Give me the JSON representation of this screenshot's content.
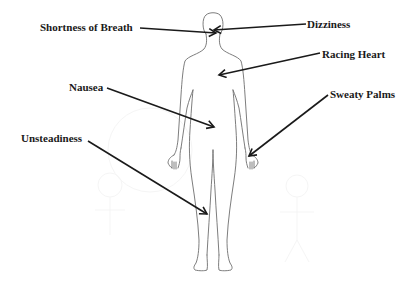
{
  "diagram": {
    "type": "annotated-body-figure",
    "colors": {
      "background": "#ffffff",
      "outline": "#6e6e6e",
      "arrow": "#1a1a1a",
      "text": "#1a1a1a"
    },
    "labels": [
      {
        "id": "shortness-of-breath",
        "text": "Shortness of Breath",
        "x": 40,
        "y": 20,
        "arrow_from": [
          140,
          27
        ],
        "arrow_to": [
          216,
          32
        ]
      },
      {
        "id": "dizziness",
        "text": "Dizziness",
        "x": 307,
        "y": 14,
        "arrow_from": [
          306,
          20
        ],
        "arrow_to": [
          214,
          25
        ]
      },
      {
        "id": "racing-heart",
        "text": "Racing Heart",
        "x": 322,
        "y": 44,
        "arrow_from": [
          320,
          50
        ],
        "arrow_to": [
          219,
          75
        ]
      },
      {
        "id": "nausea",
        "text": "Nausea",
        "x": 69,
        "y": 80,
        "arrow_from": [
          107,
          89
        ],
        "arrow_to": [
          215,
          128
        ]
      },
      {
        "id": "sweaty-palms",
        "text": "Sweaty Palms",
        "x": 330,
        "y": 84,
        "arrow_from": [
          328,
          95
        ],
        "arrow_to": [
          249,
          156
        ]
      },
      {
        "id": "unsteadiness",
        "text": "Unsteadiness",
        "x": 21,
        "y": 130,
        "arrow_from": [
          88,
          141
        ],
        "arrow_to": [
          207,
          215
        ]
      }
    ]
  }
}
